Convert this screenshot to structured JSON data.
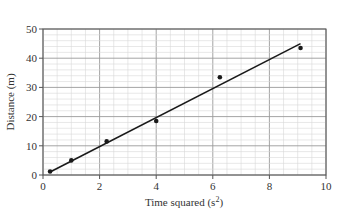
{
  "chart_data": {
    "type": "scatter",
    "title": "",
    "xlabel": "Time squared (s",
    "xlabel_sup": "2",
    "xlabel_close": ")",
    "ylabel": "Distance (m)",
    "xlim": [
      0,
      10
    ],
    "ylim": [
      0,
      50
    ],
    "xticks": [
      0,
      2,
      4,
      6,
      8,
      10
    ],
    "yticks": [
      0,
      10,
      20,
      30,
      40,
      50
    ],
    "grid": true,
    "grid_minor_x_step": 0.5,
    "grid_minor_y_step": 2,
    "points": [
      {
        "x": 0.25,
        "y": 1.2
      },
      {
        "x": 1.0,
        "y": 5.0
      },
      {
        "x": 2.25,
        "y": 11.5
      },
      {
        "x": 4.0,
        "y": 18.5
      },
      {
        "x": 6.25,
        "y": 33.5
      },
      {
        "x": 9.1,
        "y": 43.5
      }
    ],
    "fit_line": {
      "x": [
        0.25,
        9.1
      ],
      "y": [
        1.0,
        45.0
      ]
    },
    "colors": {
      "points": "#1a1a1a",
      "line": "#1a1a1a",
      "grid_minor": "#d9d9d9",
      "grid_major": "#9a9a9a",
      "axis": "#555555"
    }
  }
}
